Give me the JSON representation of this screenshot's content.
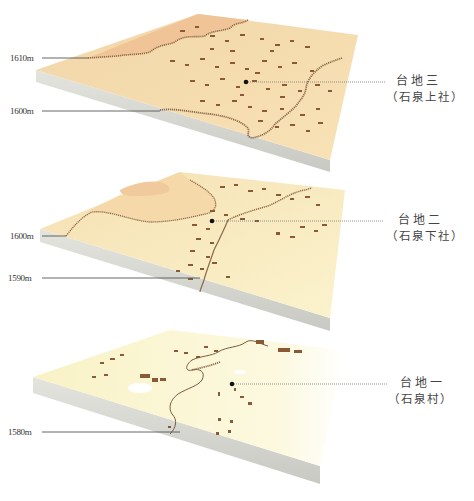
{
  "colors": {
    "upper_terrain": "#f3c89a",
    "mid_terrain": "#f7e2b4",
    "low_terrain": "#faf4cf",
    "slab_side": "#d6d6d2",
    "building": "#8a5a36",
    "leader_line": "#555555"
  },
  "terraces": [
    {
      "name": "台地三",
      "subtitle": "（石泉上社）",
      "elevations": [
        {
          "label": "1610m"
        },
        {
          "label": "1600m"
        }
      ]
    },
    {
      "name": "台地二",
      "subtitle": "（石泉下社）",
      "elevations": [
        {
          "label": "1600m"
        },
        {
          "label": "1590m"
        }
      ]
    },
    {
      "name": "台地一",
      "subtitle": "（石泉村）",
      "elevations": [
        {
          "label": "1580m"
        }
      ]
    }
  ]
}
